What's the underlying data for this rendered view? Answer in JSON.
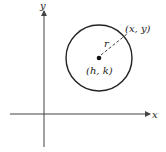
{
  "diagram": {
    "axes": {
      "x_label": "x",
      "y_label": "y"
    },
    "circle": {
      "center_label": "(h, k)",
      "point_label": "(x, y)",
      "radius_label": "r"
    },
    "colors": {
      "stroke": "#222222",
      "axis": "#444444",
      "background": "#ffffff"
    }
  }
}
